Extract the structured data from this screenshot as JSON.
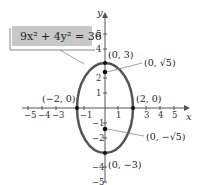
{
  "diagram": {
    "equation": "9x² + 4y² = 36",
    "axes": {
      "x_label": "x",
      "y_label": "y"
    },
    "x_ticks": [
      "−5",
      "−4",
      "−3",
      "−1",
      "1",
      "3",
      "4",
      "5"
    ],
    "y_ticks": [
      "5",
      "4",
      "2",
      "1",
      "−1",
      "−2",
      "−4",
      "−5"
    ],
    "points": {
      "top_vertex": "(0, 3)",
      "bottom_vertex": "(0, −3)",
      "left_vertex": "(−2, 0)",
      "right_vertex": "(2, 0)",
      "focus_top": "(0, √5)",
      "focus_bottom": "(0, −√5)"
    },
    "colors": {
      "ellipse": "#555555",
      "label_box": "#c8c8c8",
      "axis": "#555555"
    }
  }
}
